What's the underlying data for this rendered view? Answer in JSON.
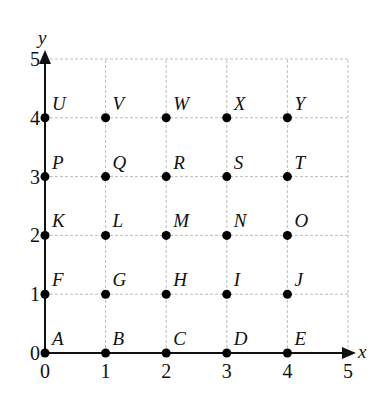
{
  "chart_data": {
    "type": "scatter",
    "title": "",
    "xlabel": "x",
    "ylabel": "y",
    "xlim": [
      0,
      5
    ],
    "ylim": [
      0,
      5
    ],
    "grid": true,
    "x_ticks": [
      "0",
      "1",
      "2",
      "3",
      "4",
      "5"
    ],
    "y_ticks": [
      "0",
      "1",
      "2",
      "3",
      "4",
      "5"
    ],
    "points": [
      {
        "label": "A",
        "x": 0,
        "y": 0
      },
      {
        "label": "B",
        "x": 1,
        "y": 0
      },
      {
        "label": "C",
        "x": 2,
        "y": 0
      },
      {
        "label": "D",
        "x": 3,
        "y": 0
      },
      {
        "label": "E",
        "x": 4,
        "y": 0
      },
      {
        "label": "F",
        "x": 0,
        "y": 1
      },
      {
        "label": "G",
        "x": 1,
        "y": 1
      },
      {
        "label": "H",
        "x": 2,
        "y": 1
      },
      {
        "label": "I",
        "x": 3,
        "y": 1
      },
      {
        "label": "J",
        "x": 4,
        "y": 1
      },
      {
        "label": "K",
        "x": 0,
        "y": 2
      },
      {
        "label": "L",
        "x": 1,
        "y": 2
      },
      {
        "label": "M",
        "x": 2,
        "y": 2
      },
      {
        "label": "N",
        "x": 3,
        "y": 2
      },
      {
        "label": "O",
        "x": 4,
        "y": 2
      },
      {
        "label": "P",
        "x": 0,
        "y": 3
      },
      {
        "label": "Q",
        "x": 1,
        "y": 3
      },
      {
        "label": "R",
        "x": 2,
        "y": 3
      },
      {
        "label": "S",
        "x": 3,
        "y": 3
      },
      {
        "label": "T",
        "x": 4,
        "y": 3
      },
      {
        "label": "U",
        "x": 0,
        "y": 4
      },
      {
        "label": "V",
        "x": 1,
        "y": 4
      },
      {
        "label": "W",
        "x": 2,
        "y": 4
      },
      {
        "label": "X",
        "x": 3,
        "y": 4
      },
      {
        "label": "Y",
        "x": 4,
        "y": 4
      }
    ]
  },
  "colors": {
    "axis": "#111111",
    "grid": "#bdbdbd",
    "point": "#000000"
  }
}
